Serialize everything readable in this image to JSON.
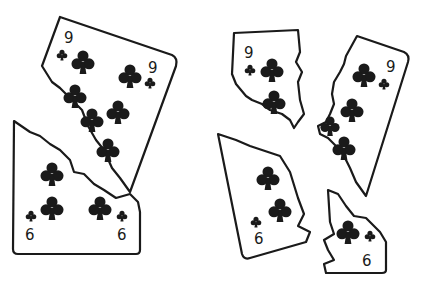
{
  "illustration": {
    "description": "Torn playing cards: nine of clubs and six of clubs, whole-overlap on left and separated pieces on right",
    "left_group": {
      "top_card": {
        "rank": "9",
        "suit": "clubs"
      },
      "bottom_card": {
        "rank": "6",
        "suit": "clubs"
      }
    },
    "right_group": {
      "pieces": [
        {
          "rank": "9",
          "suit": "clubs",
          "part": "left-piece"
        },
        {
          "rank": "9",
          "suit": "clubs",
          "part": "right-piece"
        },
        {
          "rank": "6",
          "suit": "clubs",
          "part": "left-piece"
        },
        {
          "rank": "6",
          "suit": "clubs",
          "part": "right-piece"
        }
      ]
    },
    "ink_color": "#1a1a1a",
    "background": "#ffffff"
  }
}
